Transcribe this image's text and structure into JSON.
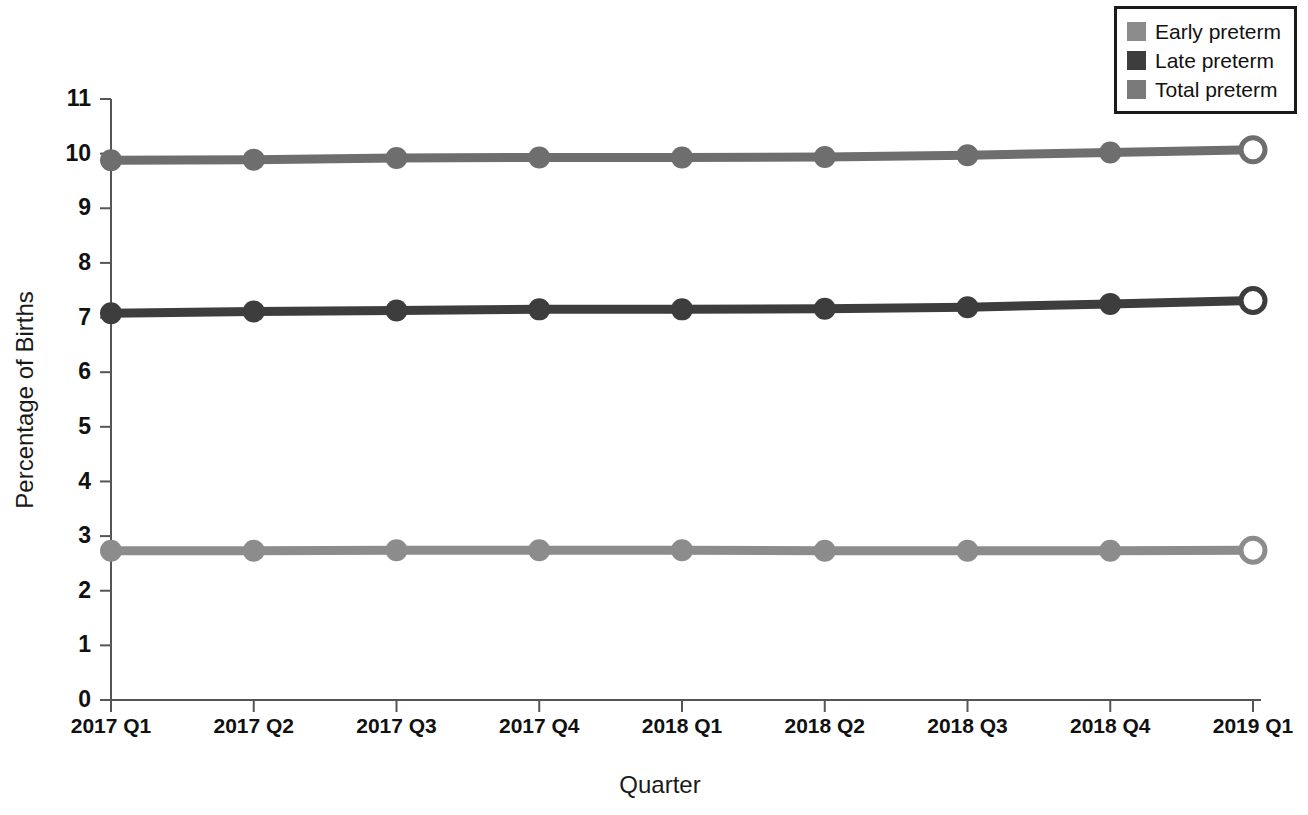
{
  "chart_data": {
    "type": "line",
    "title": "",
    "xlabel": "Quarter",
    "ylabel": "Percentage of Births",
    "categories": [
      "2017 Q1",
      "2017 Q2",
      "2017 Q3",
      "2017 Q4",
      "2018 Q1",
      "2018 Q2",
      "2018 Q3",
      "2018 Q4",
      "2019 Q1"
    ],
    "ylim": [
      0,
      11
    ],
    "yticks": [
      0,
      1,
      2,
      3,
      4,
      5,
      6,
      7,
      8,
      9,
      10,
      11
    ],
    "grid": false,
    "legend_position": "top-right",
    "marker": "circle",
    "last_point_marker": "open-circle",
    "series": [
      {
        "name": "Early preterm",
        "color": "#8c8c8c",
        "values": [
          2.73,
          2.73,
          2.74,
          2.74,
          2.74,
          2.73,
          2.73,
          2.73,
          2.74
        ]
      },
      {
        "name": "Late preterm",
        "color": "#3d3d3d",
        "values": [
          7.08,
          7.11,
          7.13,
          7.15,
          7.15,
          7.16,
          7.19,
          7.25,
          7.31
        ]
      },
      {
        "name": "Total preterm",
        "color": "#6e6e6e",
        "values": [
          9.88,
          9.89,
          9.92,
          9.93,
          9.93,
          9.94,
          9.97,
          10.02,
          10.07
        ]
      }
    ]
  },
  "legend": {
    "items": [
      {
        "label": "Early preterm",
        "color": "#8c8c8c"
      },
      {
        "label": "Late preterm",
        "color": "#3d3d3d"
      },
      {
        "label": "Total preterm",
        "color": "#7a7a7a"
      }
    ]
  },
  "axes": {
    "x_title": "Quarter",
    "y_title": "Percentage of Births"
  }
}
